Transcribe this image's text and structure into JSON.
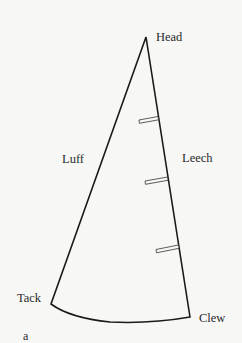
{
  "diagram": {
    "labels": {
      "head": "Head",
      "luff": "Luff",
      "leech": "Leech",
      "tack": "Tack",
      "clew": "Clew"
    },
    "figure_label": "a",
    "points": {
      "head": [
        146,
        37
      ],
      "tack": [
        51,
        304
      ],
      "clew": [
        190,
        317
      ]
    },
    "battens": [
      {
        "left": [
          139,
          121
        ],
        "right": [
          158,
          118
        ]
      },
      {
        "left": [
          145,
          182
        ],
        "right": [
          167,
          178
        ]
      },
      {
        "left": [
          156,
          251
        ],
        "right": [
          178,
          246
        ]
      }
    ],
    "colors": {
      "background": "#f7f7f6",
      "line": "#1a1a1a",
      "text": "#2a2a2a"
    }
  }
}
